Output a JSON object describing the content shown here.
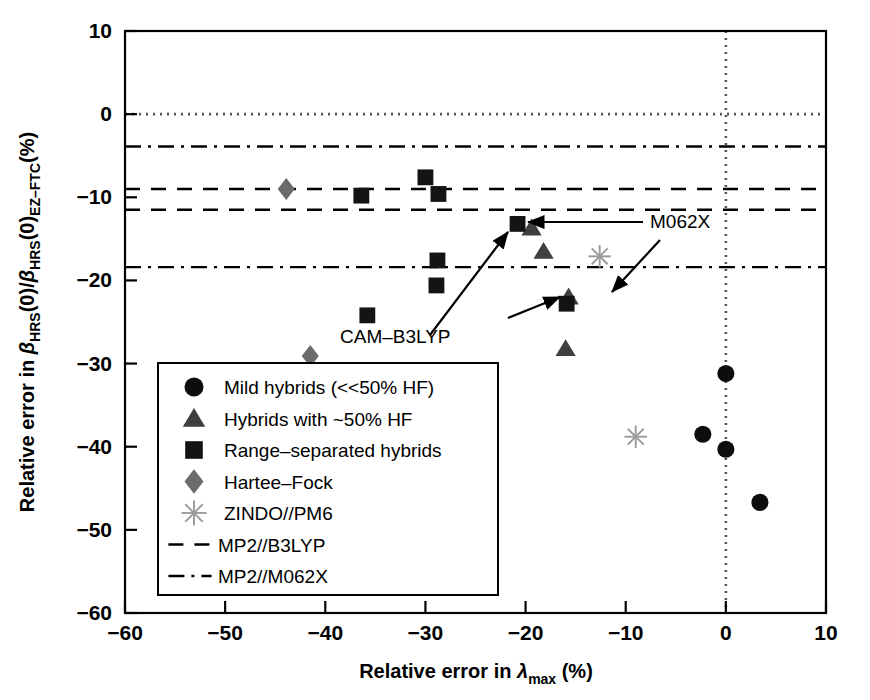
{
  "chart_data": {
    "type": "scatter",
    "title": "",
    "xlabel": "Relative error in λmax (%)",
    "xlabel_parts": {
      "pre": "Relative error in ",
      "sym": "λ",
      "sub": "max",
      "post": " (%)"
    },
    "ylabel": "Relative error in βHRS(0)/βHRS(0)EZ-FTC (%)",
    "ylabel_parts": {
      "pre": "Relative error in ",
      "b1": "β",
      "s1": "HRS",
      "m1": "(0)/",
      "b2": "β",
      "s2": "HRS",
      "m2": "(0)",
      "s3": "EZ–FTC",
      "post": "(%)"
    },
    "xlim": [
      -60,
      10
    ],
    "ylim": [
      -60,
      10
    ],
    "xticks": [
      -60,
      -50,
      -40,
      -30,
      -20,
      -10,
      0,
      10
    ],
    "yticks": [
      10,
      0,
      -10,
      -20,
      -30,
      -40,
      -50,
      -60
    ],
    "xtick_labels": [
      "−60",
      "−50",
      "−40",
      "−30",
      "−20",
      "−10",
      "0",
      "10"
    ],
    "ytick_labels": [
      "10",
      "0",
      "−10",
      "−20",
      "−30",
      "−40",
      "−50",
      "−60"
    ],
    "grid": false,
    "legend_position": "lower-left",
    "reference_lines": [
      {
        "name": "zero-horizontal",
        "orient": "h",
        "value": 0.0,
        "style": "dotted",
        "color": "#555555"
      },
      {
        "name": "zero-vertical",
        "orient": "v",
        "value": 0.0,
        "style": "dotted",
        "color": "#555555"
      },
      {
        "name": "mp2-m062x-upper",
        "orient": "h",
        "value": -3.9,
        "style": "dashdot",
        "color": "#000000"
      },
      {
        "name": "mp2-b3lyp-upper",
        "orient": "h",
        "value": -9.0,
        "style": "dashed",
        "color": "#000000"
      },
      {
        "name": "mp2-b3lyp-lower",
        "orient": "h",
        "value": -11.5,
        "style": "dashed",
        "color": "#000000"
      },
      {
        "name": "mp2-m062x-lower",
        "orient": "h",
        "value": -18.4,
        "style": "dashdot",
        "color": "#000000"
      }
    ],
    "series": [
      {
        "name": "Mild hybrids (<<50% HF)",
        "marker": "circle",
        "color": "#0d0d0d",
        "points": [
          [
            0.0,
            -31.2
          ],
          [
            -2.3,
            -38.5
          ],
          [
            0.0,
            -40.3
          ],
          [
            3.4,
            -46.7
          ]
        ]
      },
      {
        "name": "Hybrids with ~50% HF",
        "marker": "triangle",
        "color": "#3f3f3f",
        "points": [
          [
            -19.4,
            -13.7
          ],
          [
            -18.2,
            -16.5
          ],
          [
            -15.7,
            -22.0
          ],
          [
            -16.0,
            -28.2
          ]
        ]
      },
      {
        "name": "Range–separated hybrids",
        "marker": "square",
        "color": "#141414",
        "points": [
          [
            -36.4,
            -9.8
          ],
          [
            -30.0,
            -7.6
          ],
          [
            -28.7,
            -9.6
          ],
          [
            -28.8,
            -17.6
          ],
          [
            -28.9,
            -20.6
          ],
          [
            -35.8,
            -24.2
          ],
          [
            -20.8,
            -13.2
          ],
          [
            -15.9,
            -22.8
          ]
        ]
      },
      {
        "name": "Hartee–Fock",
        "marker": "diamond",
        "color": "#6b6b6b",
        "points": [
          [
            -43.9,
            -9.0
          ],
          [
            -41.5,
            -29.1
          ]
        ]
      },
      {
        "name": "ZINDO//PM6",
        "marker": "asterisk",
        "color": "#9a9a9a",
        "points": [
          [
            -12.6,
            -17.1
          ],
          [
            -9.0,
            -38.8
          ]
        ]
      }
    ],
    "annotations": [
      {
        "text": "M062X",
        "x": 650,
        "y": 228,
        "arrows": [
          [
            [
              643,
              222
            ],
            [
              528,
              222
            ]
          ],
          [
            [
              660,
              240
            ],
            [
              612,
              292
            ]
          ]
        ]
      },
      {
        "text": "CAM–B3LYP",
        "x": 340,
        "y": 343,
        "arrows": [
          [
            [
              430,
              335
            ],
            [
              508,
              232
            ]
          ],
          [
            [
              508,
              318
            ],
            [
              560,
              297
            ]
          ]
        ]
      }
    ]
  },
  "legend": {
    "items": [
      {
        "marker": "circle",
        "label": "Mild hybrids (<<50% HF)",
        "color": "#0d0d0d"
      },
      {
        "marker": "triangle",
        "label": "Hybrids with ~50% HF",
        "color": "#3f3f3f"
      },
      {
        "marker": "square",
        "label": "Range–separated hybrids",
        "color": "#141414"
      },
      {
        "marker": "diamond",
        "label": "Hartee–Fock",
        "color": "#6b6b6b"
      },
      {
        "marker": "asterisk",
        "label": "ZINDO//PM6",
        "color": "#9a9a9a"
      },
      {
        "marker": "dashed",
        "label": "MP2//B3LYP",
        "color": "#000000"
      },
      {
        "marker": "dashdot",
        "label": "MP2//M062X",
        "color": "#000000"
      }
    ]
  }
}
